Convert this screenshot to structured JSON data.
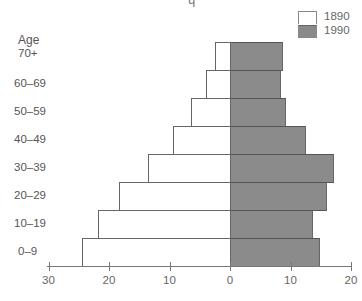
{
  "chart_data": {
    "type": "bar",
    "orientation": "horizontal",
    "subtype": "population-pyramid",
    "title": "",
    "xlabel": "",
    "ylabel": "Age",
    "categories": [
      "70+",
      "60–69",
      "50–59",
      "40–49",
      "30–39",
      "20–29",
      "10–19",
      "0–9"
    ],
    "series": [
      {
        "name": "1890",
        "side": "left",
        "color": "#ffffff",
        "values": [
          2.5,
          4.0,
          6.4,
          9.4,
          13.6,
          18.3,
          21.8,
          24.5
        ]
      },
      {
        "name": "1990",
        "side": "right",
        "color": "#8b8b8b",
        "values": [
          8.8,
          8.4,
          9.3,
          12.5,
          17.2,
          16.0,
          13.8,
          14.9
        ]
      }
    ],
    "xlim_left": [
      0,
      30
    ],
    "xlim_right": [
      0,
      20
    ],
    "x_ticks": [
      {
        "value": -30,
        "label": "30"
      },
      {
        "value": -20,
        "label": "20"
      },
      {
        "value": -10,
        "label": "10"
      },
      {
        "value": 0,
        "label": "0"
      },
      {
        "value": 10,
        "label": "10"
      },
      {
        "value": 20,
        "label": "20"
      }
    ],
    "grid": false,
    "legend_position": "top-right"
  },
  "legend": {
    "items": [
      {
        "label": "1890",
        "color": "#ffffff"
      },
      {
        "label": "1990",
        "color": "#8b8b8b"
      }
    ]
  },
  "axis": {
    "y_header": "Age"
  }
}
